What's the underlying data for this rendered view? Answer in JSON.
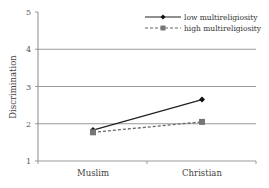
{
  "chart_data": {
    "type": "line",
    "title": "",
    "xlabel": "",
    "ylabel": "Discrimination",
    "categories": [
      "Muslim",
      "Christian"
    ],
    "series": [
      {
        "name": "low multireligiosity",
        "values": [
          1.83,
          2.65
        ],
        "line_style": "solid",
        "marker": "diamond",
        "color": "#222222"
      },
      {
        "name": "high multireligiosity",
        "values": [
          1.77,
          2.05
        ],
        "line_style": "dashed",
        "marker": "square",
        "color": "#666666"
      }
    ],
    "ylim": [
      1,
      5
    ],
    "yticks": [
      "1",
      "2",
      "3",
      "4",
      "5"
    ],
    "grid": true,
    "legend_position": "top-right"
  }
}
